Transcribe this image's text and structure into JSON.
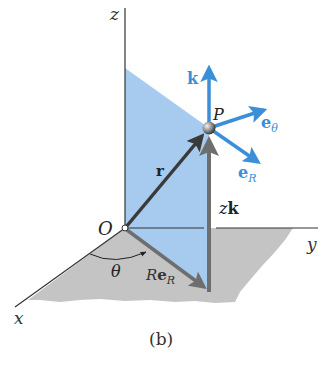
{
  "figure": {
    "caption": "(b)",
    "colors": {
      "background": "#ffffff",
      "plane": "#a7cbef",
      "floor": "#c4c4c4",
      "axis": "#333333",
      "vector_dark": "#3a3a3a",
      "vector_gray": "#6e6e6e",
      "unit_vector_blue": "#3a8fd8"
    },
    "axes": {
      "x_label": "x",
      "y_label": "y",
      "z_label": "z"
    },
    "points": {
      "origin_label": "O",
      "point_label": "P"
    },
    "vectors": {
      "position_label": "r",
      "radial_component_main": "Re",
      "radial_component_sub": "R",
      "vertical_component": "zk",
      "vertical_component_z": "z",
      "vertical_component_k": "k"
    },
    "unit_vectors": {
      "k_label": "k",
      "e_theta_main": "e",
      "e_theta_sub": "θ",
      "e_R_main": "e",
      "e_R_sub": "R"
    },
    "angle": {
      "label": "θ"
    }
  }
}
